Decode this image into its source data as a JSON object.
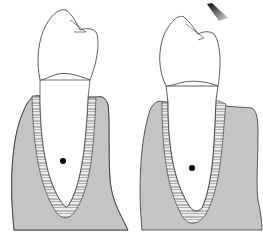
{
  "figure": {
    "panels": [
      {
        "id": "left",
        "label": "tooth-at-rest",
        "center_of_rotation": [
          63,
          161
        ]
      },
      {
        "id": "right",
        "label": "tooth-under-force",
        "center_of_rotation": [
          192,
          168
        ]
      }
    ],
    "force_arrow": {
      "direction": "down-left",
      "position": [
        217,
        12
      ]
    }
  },
  "colors": {
    "bone": "#c4c4c4",
    "outline": "#333333",
    "tooth": "#ffffff",
    "ligament": "#e6e6e6",
    "dot": "#000000"
  }
}
